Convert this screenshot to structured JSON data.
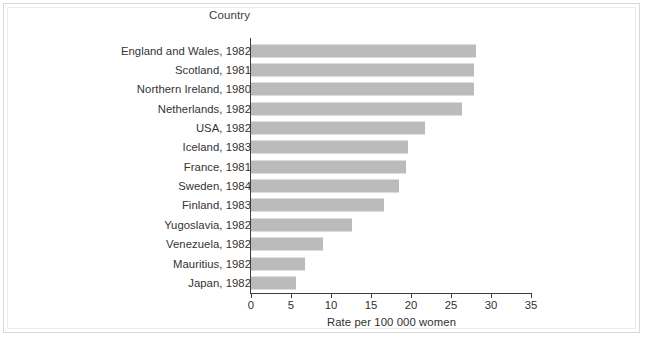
{
  "chart_data": {
    "type": "bar",
    "orientation": "horizontal",
    "title": "Country",
    "xlabel": "Rate per 100 000 women",
    "ylabel": "Country",
    "xlim": [
      0,
      35
    ],
    "xticks": [
      0,
      5,
      10,
      15,
      20,
      25,
      30,
      35
    ],
    "grid": false,
    "legend": null,
    "bar_color": "#bbbbbb",
    "axis_color": "#3d3d3d",
    "text_color": "#333333",
    "categories": [
      "England and Wales, 1982",
      "Scotland, 1981",
      "Northern Ireland, 1980",
      "Netherlands, 1982",
      "USA, 1982",
      "Iceland, 1983",
      "France, 1981",
      "Sweden, 1984",
      "Finland, 1983",
      "Yugoslavia, 1982",
      "Venezuela, 1982",
      "Mauritius, 1982",
      "Japan, 1982"
    ],
    "values": [
      28.1,
      27.9,
      27.9,
      26.4,
      21.8,
      19.6,
      19.4,
      18.5,
      16.6,
      12.6,
      9.0,
      6.8,
      5.6
    ]
  }
}
